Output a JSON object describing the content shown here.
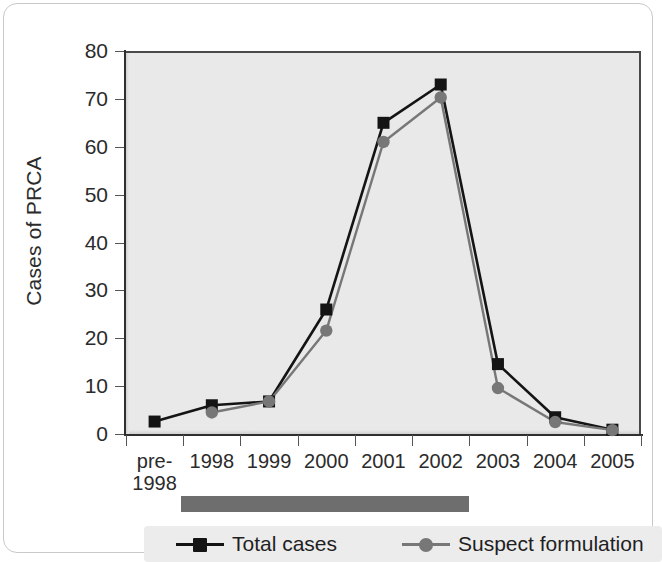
{
  "chart_data": {
    "type": "line",
    "title": "",
    "xlabel": "",
    "ylabel": "Cases of PRCA",
    "categories": [
      "pre-1998",
      "1998",
      "1999",
      "2000",
      "2001",
      "2002",
      "2003",
      "2004",
      "2005"
    ],
    "category_lines": [
      [
        "pre-",
        "1998"
      ],
      [
        "1998",
        ""
      ],
      [
        "1999",
        ""
      ],
      [
        "2000",
        ""
      ],
      [
        "2001",
        ""
      ],
      [
        "2002",
        ""
      ],
      [
        "2003",
        ""
      ],
      [
        "2004",
        ""
      ],
      [
        "2005",
        ""
      ]
    ],
    "ylim": [
      0,
      80
    ],
    "yticks": [
      0,
      10,
      20,
      30,
      40,
      50,
      60,
      70,
      80
    ],
    "ytick_labels": [
      "0",
      "10",
      "20",
      "30",
      "40",
      "50",
      "60",
      "70",
      "80"
    ],
    "grid": false,
    "legend_position": "bottom",
    "series": [
      {
        "name": "Total cases",
        "marker": "square",
        "color": "#141414",
        "values": [
          2.6,
          6.0,
          6.8,
          26.0,
          65.0,
          73.0,
          14.6,
          3.5,
          0.9
        ]
      },
      {
        "name": "Suspect formulation",
        "marker": "circle",
        "color": "#777777",
        "values": [
          null,
          4.5,
          6.8,
          21.6,
          61.0,
          70.3,
          9.6,
          2.5,
          0.8
        ]
      }
    ],
    "annotations": [
      {
        "name": "suspect-formulation-period-bar",
        "label": "",
        "from": "1998",
        "to": "2002",
        "color": "#6e6e6e"
      }
    ]
  },
  "legend": {
    "items": [
      {
        "label": "Total cases",
        "marker": "square",
        "color": "#141414"
      },
      {
        "label": "Suspect formulation",
        "marker": "circle",
        "color": "#777777"
      }
    ]
  },
  "axis": {
    "y_title": "Cases of PRCA"
  },
  "colors": {
    "plot_background": "#e9e9e9",
    "axis": "#2f2f2f",
    "series_total": "#141414",
    "series_suspect": "#777777",
    "period_bar": "#6e6e6e",
    "legend_background": "#ececec",
    "card_border": "#c9c9c9"
  }
}
